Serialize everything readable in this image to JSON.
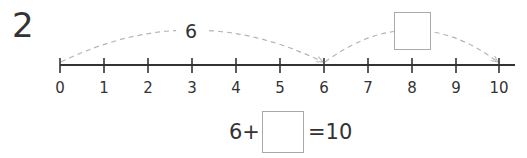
{
  "problem": {
    "number": "2",
    "number_line": {
      "ticks": [
        "0",
        "1",
        "2",
        "3",
        "4",
        "5",
        "6",
        "7",
        "8",
        "9",
        "10"
      ],
      "jumps": [
        {
          "from": "0",
          "to": "6",
          "label": "6"
        },
        {
          "from": "6",
          "to": "10",
          "label": ""
        }
      ]
    },
    "equation": {
      "left": "6+",
      "answer_value": "",
      "right": "=10"
    },
    "jump_box_value": ""
  },
  "colors": {
    "line": "#333333",
    "arc": "#b5b5b5",
    "box_border": "#aaaaaa"
  }
}
